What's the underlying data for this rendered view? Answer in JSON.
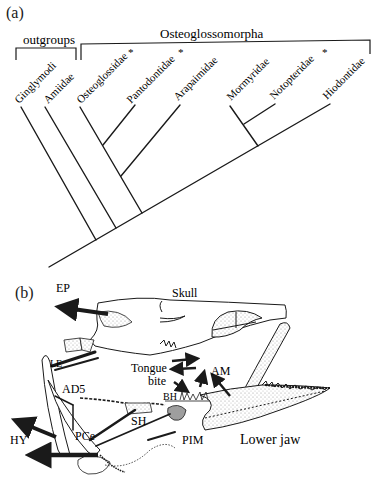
{
  "panel_a": {
    "label": "(a)",
    "groups": {
      "outgroups": "outgroups",
      "ingroup": "Osteoglossomorpha"
    },
    "taxa": [
      {
        "name": "Ginglymodi",
        "asterisk": ""
      },
      {
        "name": "Amiidae",
        "asterisk": ""
      },
      {
        "name": "Osteoglossidae",
        "asterisk": "*"
      },
      {
        "name": "Pantodontidae",
        "asterisk": "*"
      },
      {
        "name": "Arapaimidae",
        "asterisk": ""
      },
      {
        "name": "Mormyridae",
        "asterisk": ""
      },
      {
        "name": "Notopteridae",
        "asterisk": "*"
      },
      {
        "name": "Hiodontidae",
        "asterisk": ""
      }
    ]
  },
  "panel_b": {
    "label": "(b)",
    "labels": {
      "skull": "Skull",
      "ep": "EP",
      "le": "LE",
      "ad5": "AD5",
      "tongue": "Tongue",
      "bite": "bite",
      "am": "AM",
      "bh": "BH",
      "sh": "SH",
      "pce": "PCe",
      "hy": "HY",
      "pim": "PIM",
      "lower_jaw": "Lower jaw"
    }
  },
  "colors": {
    "ink": "#1a1a1a",
    "stipple": "#bdbdbd",
    "background": "#ffffff"
  }
}
